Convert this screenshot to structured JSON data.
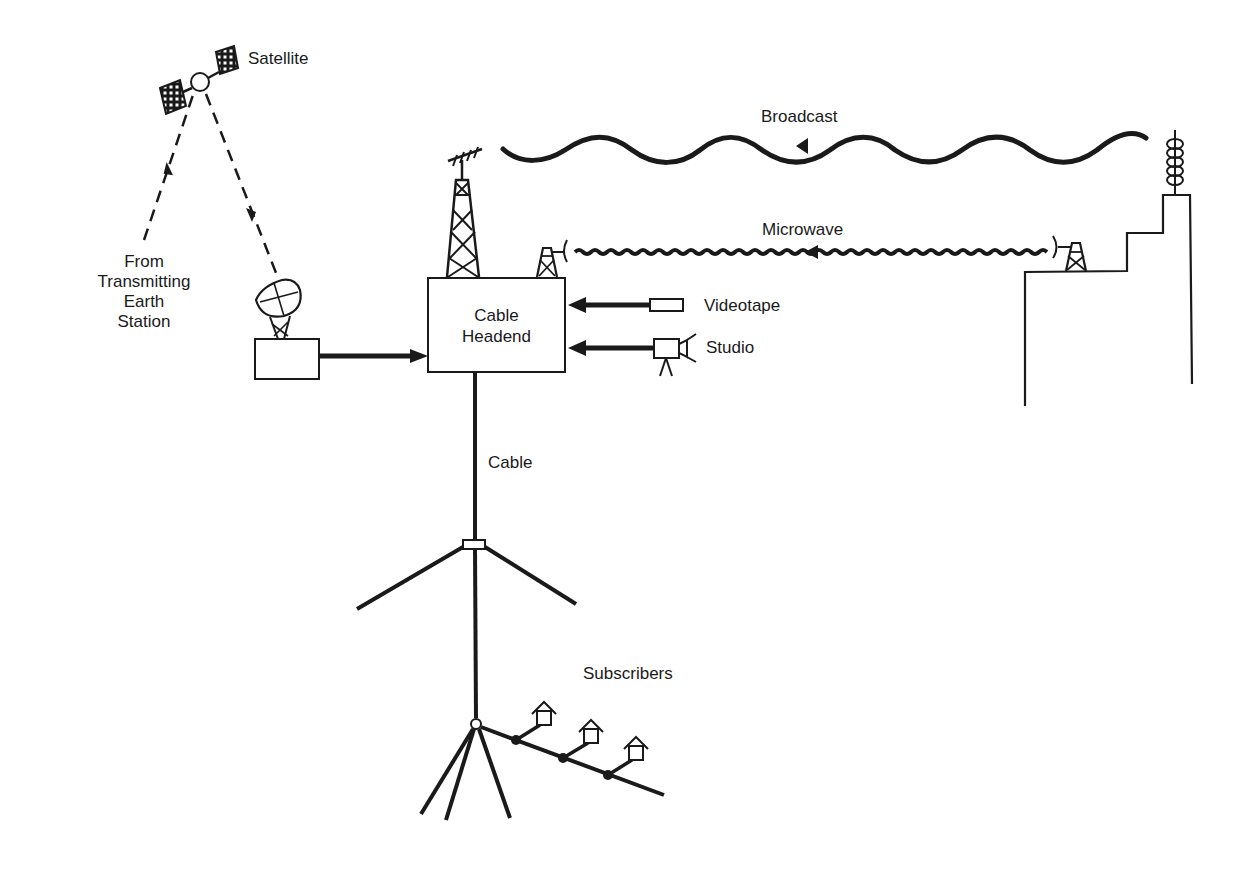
{
  "colors": {
    "ink": "#1a1a1a",
    "background": "#ffffff"
  },
  "labels": {
    "satellite": "Satellite",
    "from_earth_station": [
      "From",
      "Transmitting",
      "Earth",
      "Station"
    ],
    "broadcast": "Broadcast",
    "microwave": "Microwave",
    "headend": [
      "Cable",
      "Headend"
    ],
    "videotape": "Videotape",
    "studio": "Studio",
    "cable": "Cable",
    "subscribers": "Subscribers"
  },
  "nodes": [
    {
      "id": "satellite",
      "label": "Satellite"
    },
    {
      "id": "earth-station",
      "label": "From Transmitting Earth Station"
    },
    {
      "id": "receive-dish",
      "label": ""
    },
    {
      "id": "cable-headend",
      "label": "Cable Headend"
    },
    {
      "id": "videotape",
      "label": "Videotape"
    },
    {
      "id": "studio",
      "label": "Studio"
    },
    {
      "id": "broadcast-tower",
      "label": ""
    },
    {
      "id": "microwave-relay",
      "label": ""
    },
    {
      "id": "subscribers",
      "label": "Subscribers"
    }
  ],
  "edges": [
    {
      "from": "earth-station",
      "to": "satellite",
      "style": "dashed"
    },
    {
      "from": "satellite",
      "to": "receive-dish",
      "style": "dashed"
    },
    {
      "from": "receive-dish",
      "to": "cable-headend",
      "style": "solid-arrow"
    },
    {
      "from": "broadcast-tower",
      "to": "cable-headend",
      "label": "Broadcast",
      "style": "wave"
    },
    {
      "from": "microwave-relay",
      "to": "cable-headend",
      "label": "Microwave",
      "style": "tight-wave"
    },
    {
      "from": "videotape",
      "to": "cable-headend",
      "style": "solid-arrow"
    },
    {
      "from": "studio",
      "to": "cable-headend",
      "style": "solid-arrow"
    },
    {
      "from": "cable-headend",
      "to": "subscribers",
      "label": "Cable",
      "style": "solid"
    }
  ]
}
